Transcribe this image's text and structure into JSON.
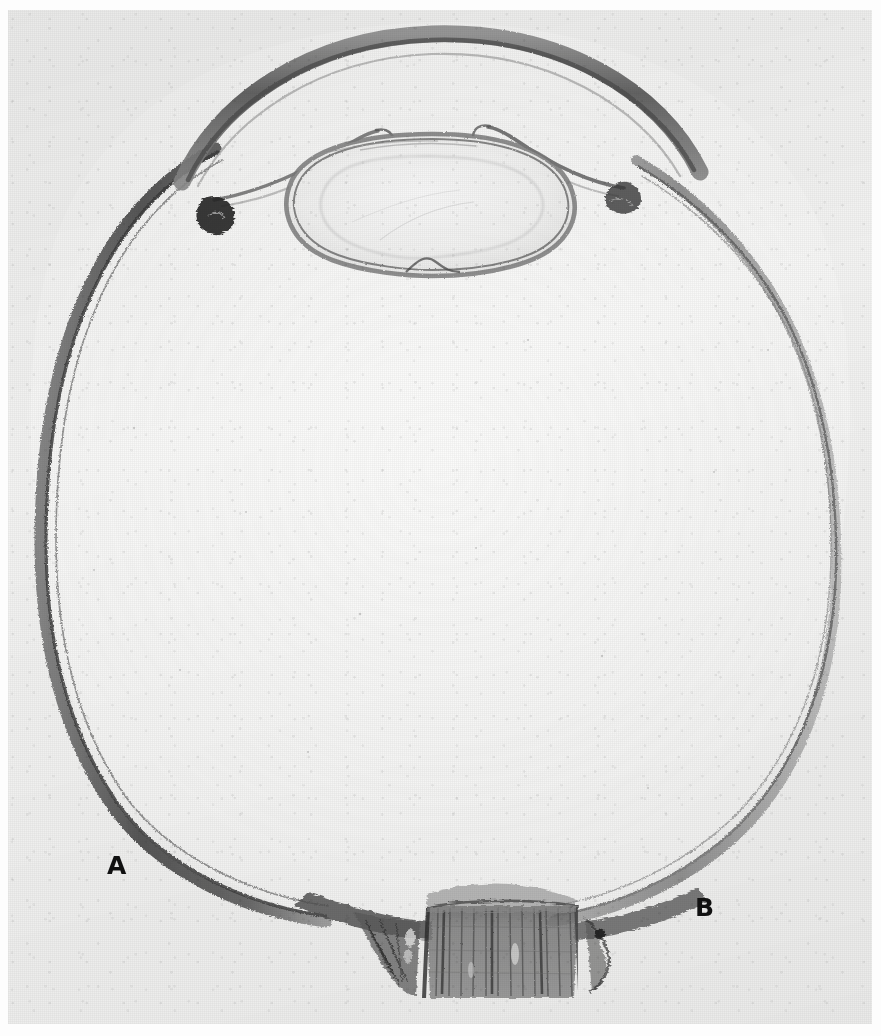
{
  "figure": {
    "kind": "photomicrograph",
    "plate_background_color": "#f3f3f2",
    "ink_color": "#3a3a3a",
    "label_color": "#111111",
    "width_px": 881,
    "height_px": 1036
  },
  "labels": [
    {
      "id": "a",
      "text": "A",
      "x": 115,
      "y": 865
    },
    {
      "id": "b",
      "text": "B",
      "x": 703,
      "y": 907
    }
  ],
  "structures": [
    {
      "name": "cornea",
      "note": "thick dark arc forming the anterior roof of the globe"
    },
    {
      "name": "sclera",
      "note": "outer fibrous coat, dark band encircling the globe"
    },
    {
      "name": "choroid",
      "note": "pigmented layer just inside sclera"
    },
    {
      "name": "retina",
      "note": "innermost thin line of the globe wall"
    },
    {
      "name": "anterior-chamber",
      "note": "pale space between cornea and iris/lens"
    },
    {
      "name": "iris",
      "note": "thin strands running from the angle toward the pupil"
    },
    {
      "name": "ciliary-body",
      "note": "dark clumps at the iridocorneal angles"
    },
    {
      "name": "lens",
      "note": "oval body with a dark capsule, beneath the pupil"
    },
    {
      "name": "vitreous-cavity",
      "note": "large pale interior of the globe"
    },
    {
      "name": "optic-disc",
      "note": "posterior pole where the nerve leaves the globe"
    },
    {
      "name": "optic-nerve",
      "note": "vertically striated column below the posterior pole"
    }
  ]
}
